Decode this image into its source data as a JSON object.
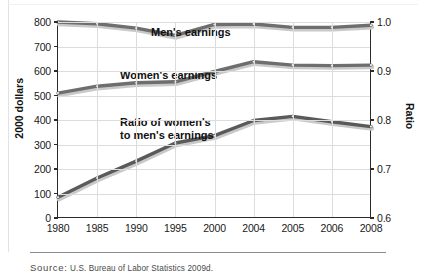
{
  "chart_data": {
    "type": "line",
    "title": "",
    "categories": [
      "1980",
      "1985",
      "1990",
      "1995",
      "2000",
      "2004",
      "2005",
      "2006",
      "2008"
    ],
    "series": [
      {
        "name": "Men's earnings",
        "axis": "left",
        "values": [
          800,
          793,
          775,
          745,
          790,
          792,
          778,
          778,
          787
        ],
        "color": "#6e6e6e"
      },
      {
        "name": "Women's earnings",
        "axis": "left",
        "values": [
          510,
          538,
          552,
          556,
          598,
          638,
          624,
          622,
          624
        ],
        "color": "#6e6e6e"
      },
      {
        "name": "Ratio of women's to men's earnings",
        "axis": "right",
        "values": [
          0.643,
          0.682,
          0.716,
          0.753,
          0.768,
          0.799,
          0.808,
          0.797,
          0.787
        ],
        "values_in_left_units": [
          85,
          163,
          232,
          306,
          336,
          398,
          415,
          393,
          373
        ],
        "color": "#5a5a5a"
      }
    ],
    "xlabel": "",
    "ylabel": "2000 dollars",
    "ylabel_right": "Ratio",
    "ylim": [
      0,
      800
    ],
    "ylim_right": [
      0.6,
      1.0
    ],
    "yticks": [
      "0",
      "100",
      "200",
      "300",
      "400",
      "500",
      "600",
      "700",
      "800"
    ],
    "yticks_right": [
      "0.6",
      "0.7",
      "0.8",
      "0.9",
      "1.0"
    ],
    "grid": true,
    "legend": "inline-annotations",
    "annotations": [
      {
        "id": "men",
        "text": "Men's earnings"
      },
      {
        "id": "women",
        "text": "Women's earnings"
      },
      {
        "id": "ratio_line1",
        "text": "Ratio of women's"
      },
      {
        "id": "ratio_line2",
        "text": "to men's earnings"
      }
    ]
  },
  "axes": {
    "left_title": "2000 dollars",
    "right_title": "Ratio",
    "left_ticks": [
      "800",
      "700",
      "600",
      "500",
      "400",
      "300",
      "200",
      "100",
      "0"
    ],
    "right_ticks": [
      "1.0",
      "0.9",
      "0.8",
      "0.7",
      "0.6"
    ],
    "x_ticks": [
      "1980",
      "1985",
      "1990",
      "1995",
      "2000",
      "2004",
      "2005",
      "2006",
      "2008"
    ]
  },
  "annotations": {
    "men": "Men's earnings",
    "women": "Women's earnings",
    "ratio_line1": "Ratio of women's",
    "ratio_line2": "to men's earnings"
  },
  "footer": {
    "source_label": "Source:",
    "source_text": "U.S. Bureau of Labor Statistics 2009d."
  },
  "colors": {
    "series_line": "#6e6e6e",
    "series_line_dark": "#4c4c4c",
    "axis": "#2b2b2b",
    "grid": "#dcdcdc",
    "text": "#111111"
  }
}
